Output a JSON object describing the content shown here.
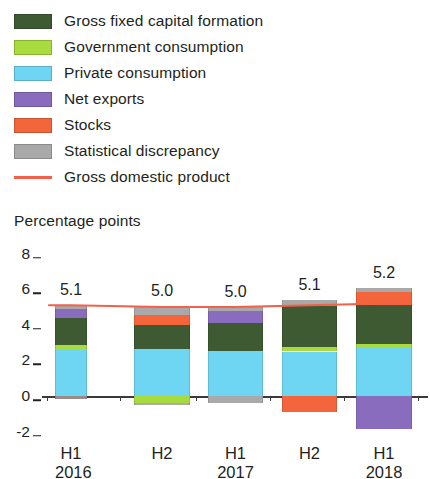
{
  "legend": {
    "items": [
      {
        "label": "Gross fixed capital formation",
        "color": "#3d5a33",
        "type": "swatch",
        "icon": "legend-swatch"
      },
      {
        "label": "Government consumption",
        "color": "#a8dc3e",
        "type": "swatch",
        "icon": "legend-swatch"
      },
      {
        "label": "Private consumption",
        "color": "#6ed6f2",
        "type": "swatch",
        "icon": "legend-swatch"
      },
      {
        "label": "Net exports",
        "color": "#8a6cbe",
        "type": "swatch",
        "icon": "legend-swatch"
      },
      {
        "label": "Stocks",
        "color": "#f4653c",
        "type": "swatch",
        "icon": "legend-swatch"
      },
      {
        "label": "Statistical discrepancy",
        "color": "#a9a9a9",
        "type": "swatch",
        "icon": "legend-swatch"
      },
      {
        "label": "Gross domestic product",
        "color": "#f4604a",
        "type": "line",
        "icon": "legend-line"
      }
    ]
  },
  "axis": {
    "y_title": "Percentage points",
    "y_ticks": [
      "8",
      "6",
      "4",
      "2",
      "0",
      "-2"
    ]
  },
  "xlabels": [
    {
      "period": "H1",
      "year": "2016"
    },
    {
      "period": "H2",
      "year": ""
    },
    {
      "period": "H1",
      "year": "2017"
    },
    {
      "period": "H2",
      "year": ""
    },
    {
      "period": "H1",
      "year": "2018"
    }
  ],
  "chart_data": {
    "type": "bar",
    "title": "",
    "subtitle": "",
    "xlabel": "",
    "ylabel": "Percentage points",
    "ylim": [
      -2.6,
      8.4
    ],
    "yticks": [
      8,
      6,
      4,
      2,
      0,
      -2
    ],
    "grid": false,
    "stacked": true,
    "legend_position": "top-left",
    "categories": [
      "H1 2016",
      "H2 2016",
      "H1 2017",
      "H2 2017",
      "H1 2018"
    ],
    "series": [
      {
        "name": "Gross fixed capital formation",
        "color": "#3d5a33",
        "values": [
          1.55,
          1.35,
          1.45,
          1.95,
          2.2
        ]
      },
      {
        "name": "Government consumption",
        "color": "#a8dc3e",
        "values": [
          0.2,
          -0.35,
          0.0,
          0.25,
          0.2
        ]
      },
      {
        "name": "Private consumption",
        "color": "#6ed6f2",
        "values": [
          2.65,
          2.65,
          2.55,
          2.5,
          2.7
        ]
      },
      {
        "name": "Net exports",
        "color": "#8a6cbe",
        "values": [
          0.5,
          0.0,
          0.65,
          0.0,
          -1.85
        ]
      },
      {
        "name": "Stocks",
        "color": "#f4653c",
        "values": [
          0.0,
          0.55,
          0.0,
          -0.85,
          0.65
        ]
      },
      {
        "name": "Statistical discrepancy",
        "color": "#a9a9a9",
        "values": [
          0.2,
          0.45,
          -0.35,
          0.4,
          0.25
        ]
      }
    ],
    "line_series": {
      "name": "Gross domestic product",
      "color": "#f4604a",
      "values": [
        5.1,
        5.0,
        5.0,
        5.1,
        5.2
      ]
    },
    "data_labels": [
      "5.1",
      "5.0",
      "5.0",
      "5.1",
      "5.2"
    ]
  },
  "bars": [
    {
      "category": "H1 2016",
      "label": "5.1",
      "segments": [
        {
          "name": "Private consumption",
          "from": 0.0,
          "to": 2.65,
          "color": "#6ed6f2"
        },
        {
          "name": "Government consumption",
          "from": 2.65,
          "to": 2.85,
          "color": "#a8dc3e"
        },
        {
          "name": "Gross fixed capital formation",
          "from": 2.85,
          "to": 4.4,
          "color": "#3d5a33"
        },
        {
          "name": "Net exports",
          "from": 4.4,
          "to": 4.9,
          "color": "#8a6cbe"
        },
        {
          "name": "Statistical discrepancy",
          "from": 4.9,
          "to": 5.1,
          "color": "#a9a9a9"
        },
        {
          "name": "Statistical discrepancy",
          "from": -0.18,
          "to": 0.0,
          "color": "#9c8a86"
        }
      ]
    },
    {
      "category": "H2 2016",
      "label": "5.0",
      "segments": [
        {
          "name": "Private consumption",
          "from": 0.0,
          "to": 2.65,
          "color": "#6ed6f2"
        },
        {
          "name": "Gross fixed capital formation",
          "from": 2.65,
          "to": 4.0,
          "color": "#3d5a33"
        },
        {
          "name": "Stocks",
          "from": 4.0,
          "to": 4.55,
          "color": "#f4653c"
        },
        {
          "name": "Statistical discrepancy",
          "from": 4.55,
          "to": 5.05,
          "color": "#a9a9a9"
        },
        {
          "name": "Government consumption",
          "from": -0.38,
          "to": -0.02,
          "color": "#a8dc3e"
        },
        {
          "name": "Statistical discrepancy",
          "from": -0.52,
          "to": -0.38,
          "color": "#a9a9a9"
        }
      ]
    },
    {
      "category": "H1 2017",
      "label": "5.0",
      "segments": [
        {
          "name": "Private consumption",
          "from": 0.0,
          "to": 2.55,
          "color": "#6ed6f2"
        },
        {
          "name": "Gross fixed capital formation",
          "from": 2.55,
          "to": 4.1,
          "color": "#3d5a33"
        },
        {
          "name": "Net exports",
          "from": 4.1,
          "to": 4.75,
          "color": "#8a6cbe"
        },
        {
          "name": "Statistical discrepancy",
          "from": 4.75,
          "to": 4.98,
          "color": "#a9a9a9"
        },
        {
          "name": "Statistical discrepancy",
          "from": -0.38,
          "to": 0.0,
          "color": "#a9a9a9"
        }
      ]
    },
    {
      "category": "H2 2017",
      "label": "5.1",
      "segments": [
        {
          "name": "Private consumption",
          "from": 0.0,
          "to": 2.5,
          "color": "#6ed6f2"
        },
        {
          "name": "Government consumption",
          "from": 2.5,
          "to": 2.78,
          "color": "#a8dc3e"
        },
        {
          "name": "Gross fixed capital formation",
          "from": 2.78,
          "to": 5.05,
          "color": "#3d5a33"
        },
        {
          "name": "Statistical discrepancy",
          "from": 5.05,
          "to": 5.4,
          "color": "#a9a9a9"
        },
        {
          "name": "Stocks",
          "from": -0.88,
          "to": 0.0,
          "color": "#f4653c"
        }
      ]
    },
    {
      "category": "H1 2018",
      "label": "5.2",
      "segments": [
        {
          "name": "Private consumption",
          "from": 0.0,
          "to": 2.7,
          "color": "#6ed6f2"
        },
        {
          "name": "Government consumption",
          "from": 2.7,
          "to": 2.92,
          "color": "#a8dc3e"
        },
        {
          "name": "Gross fixed capital formation",
          "from": 2.92,
          "to": 5.12,
          "color": "#3d5a33"
        },
        {
          "name": "Stocks",
          "from": 5.12,
          "to": 5.85,
          "color": "#f4653c"
        },
        {
          "name": "Statistical discrepancy",
          "from": 5.85,
          "to": 6.05,
          "color": "#a9a9a9"
        },
        {
          "name": "Net exports",
          "from": -1.85,
          "to": 0.0,
          "color": "#8a6cbe"
        }
      ]
    }
  ]
}
